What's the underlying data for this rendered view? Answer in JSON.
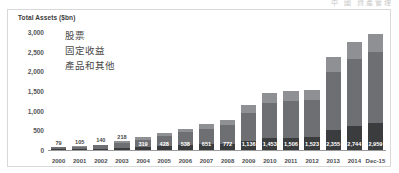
{
  "header": {
    "ghost_text": "中 國   資產管理"
  },
  "chart_data": {
    "type": "bar",
    "subtype": "stacked-bar",
    "title": "Total Assets ($bn)",
    "xlabel": "",
    "ylabel": "Total Assets ($bn)",
    "ylim": [
      0,
      3000
    ],
    "yticks": [
      "0",
      "500",
      "1,000",
      "1,500",
      "2,000",
      "2,500",
      "3,000"
    ],
    "ytick_values": [
      0,
      500,
      1000,
      1500,
      2000,
      2500,
      3000
    ],
    "grid": false,
    "legend_position": "inside-top-left",
    "legend": [
      "股票",
      "固定收益",
      "產品和其他"
    ],
    "categories": [
      "2000",
      "2001",
      "2002",
      "2003",
      "2004",
      "2005",
      "2006",
      "2007",
      "2008",
      "2009",
      "2010",
      "2011",
      "2012",
      "2013",
      "2014",
      "Dec-15"
    ],
    "totals": [
      79,
      105,
      140,
      218,
      319,
      428,
      538,
      651,
      772,
      1136,
      1453,
      1506,
      1523,
      2355,
      2744,
      2959
    ],
    "labels": [
      "79",
      "105",
      "140",
      "218",
      "319",
      "428",
      "538",
      "651",
      "772",
      "1,136",
      "1,453",
      "1,506",
      "1,523",
      "2,355",
      "2,744",
      "2,959"
    ],
    "series": [
      {
        "name": "股票",
        "color": "#3b3c3e",
        "values": [
          18,
          24,
          30,
          46,
          68,
          92,
          118,
          143,
          150,
          236,
          310,
          318,
          322,
          520,
          610,
          690
        ]
      },
      {
        "name": "固定收益",
        "color": "#6d6f72",
        "values": [
          48,
          64,
          86,
          134,
          196,
          262,
          330,
          400,
          482,
          700,
          893,
          928,
          941,
          1455,
          1694,
          1809
        ]
      },
      {
        "name": "產品和其他",
        "color": "#8e9093",
        "values": [
          13,
          17,
          24,
          38,
          55,
          74,
          90,
          108,
          140,
          200,
          250,
          260,
          260,
          380,
          440,
          460
        ]
      }
    ]
  },
  "colors": {
    "equity": "#3b3c3e",
    "fixed_income": "#6d6f72",
    "products_other": "#8e9093",
    "axis": "#9a9a9a",
    "frame": "#d8d8d8",
    "background": "#ffffff"
  }
}
